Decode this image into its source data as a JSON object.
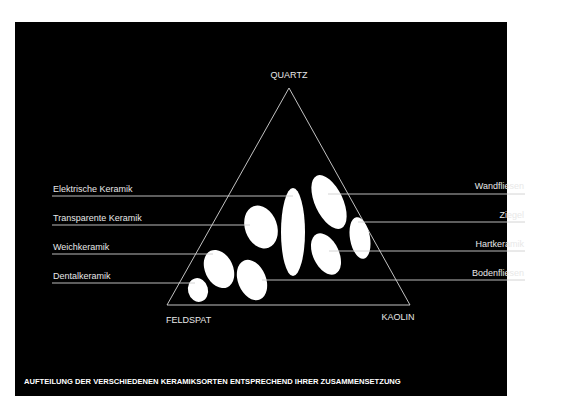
{
  "diagram": {
    "vertices": {
      "top": "QUARTZ",
      "bottom_left": "FELDSPAT",
      "bottom_right": "KAOLIN"
    },
    "left_labels": [
      "Elektrische Keramik",
      "Transparente Keramik",
      "Weichkeramik",
      "Dentalkeramik"
    ],
    "right_labels": [
      "Wandfliesen",
      "Ziegel",
      "Hartkeramik",
      "Bodenfliesen"
    ],
    "caption": "AUFTEILUNG DER VERSCHIEDENEN KERAMIKSORTEN ENTSPRECHEND IHRER ZUSAMMENSETZUNG",
    "colors": {
      "background": "#000000",
      "foreground": "#ffffff",
      "page": "#ffffff"
    }
  }
}
